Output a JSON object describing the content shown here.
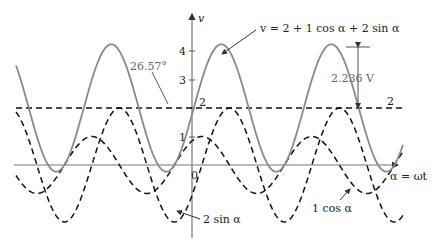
{
  "diagram": {
    "axis_y_label": "v",
    "axis_x_label": "α = ωt",
    "y_ticks": [
      "0",
      "1",
      "2",
      "3",
      "4"
    ],
    "equation_label": "v = 2 + 1 cos α + 2 sin α",
    "angle_label": "26.57°",
    "amplitude_label": "2.236 V",
    "dc_label": "2",
    "cos_label": "1 cos α",
    "sin_label": "2 sin α",
    "colors": {
      "sum_curve": "#8a8a8a",
      "dashed": "#111111",
      "axes": "#777777"
    }
  },
  "chart_data": {
    "type": "line",
    "title": "v = 2 + 1 cos α + 2 sin α",
    "xlabel": "α = ωt",
    "ylabel": "v",
    "ylim": [
      -2.2,
      4.6
    ],
    "series": [
      {
        "name": "v = 2 + 1 cos α + 2 sin α",
        "style": "solid",
        "dc": 2,
        "amplitude": 2.236,
        "phase_deg": 26.57,
        "max": 4.236,
        "min": -0.236
      },
      {
        "name": "2 (dc)",
        "style": "dashed",
        "value": 2
      },
      {
        "name": "1 cos α",
        "style": "dashed",
        "amplitude": 1
      },
      {
        "name": "2 sin α",
        "style": "dashed",
        "amplitude": 2
      }
    ],
    "annotations": [
      "26.57°",
      "2.236 V",
      "2"
    ]
  }
}
